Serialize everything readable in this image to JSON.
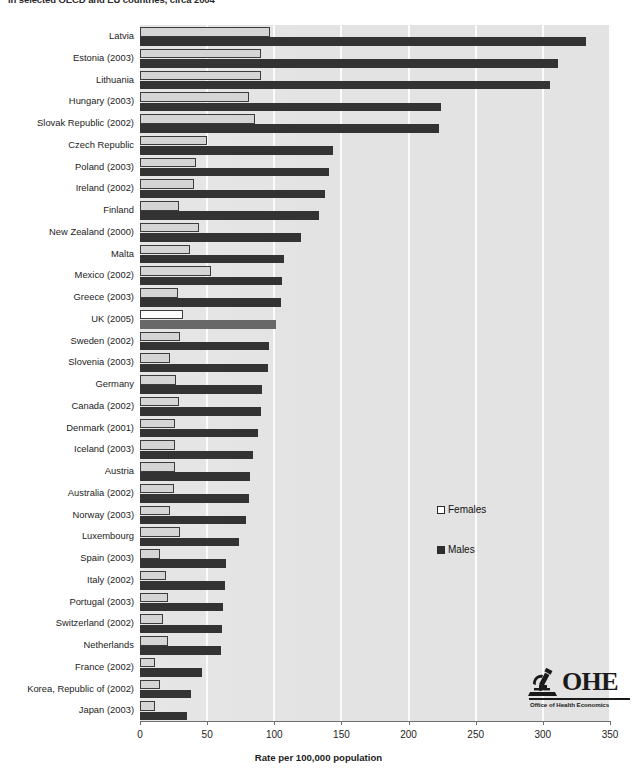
{
  "title": "in selected OECD and EU countries, circa 2004",
  "legend": {
    "female_label": "Females",
    "male_label": "Males"
  },
  "logo": {
    "letters": "OHE",
    "subtitle": "Office of Health Economics"
  },
  "colors": {
    "female_bar": "#d5d5d5",
    "male_bar": "#333333",
    "highlight_female_bar": "#fcfcfc",
    "highlight_male_bar": "#686868",
    "plot_background": "#e3e3e3",
    "gridline": "#fbfbfb"
  },
  "chart_data": {
    "type": "bar",
    "orientation": "horizontal",
    "title": "in selected OECD and EU countries, circa 2004",
    "xlabel": "Rate per 100,000 population",
    "ylabel": "",
    "xlim": [
      0,
      350
    ],
    "xticks": [
      0,
      50,
      100,
      150,
      200,
      250,
      300,
      350
    ],
    "grid": true,
    "legend_position": "center-right",
    "highlight_category": "UK (2005)",
    "categories": [
      "Latvia",
      "Estonia (2003)",
      "Lithuania",
      "Hungary (2003)",
      "Slovak Republic (2002)",
      "Czech Republic",
      "Poland (2003)",
      "Ireland (2002)",
      "Finland",
      "New Zealand (2000)",
      "Malta",
      "Mexico (2002)",
      "Greece (2003)",
      "UK (2005)",
      "Sweden (2002)",
      "Slovenia (2003)",
      "Germany",
      "Canada (2002)",
      "Denmark (2001)",
      "Iceland (2003)",
      "Austria",
      "Australia (2002)",
      "Norway (2003)",
      "Luxembourg",
      "Spain (2003)",
      "Italy (2002)",
      "Portugal (2003)",
      "Switzerland (2002)",
      "Netherlands",
      "France (2002)",
      "Korea, Republic of (2002)",
      "Japan (2003)"
    ],
    "series": [
      {
        "name": "Females",
        "values": [
          97,
          90,
          90,
          81,
          86,
          50,
          42,
          40,
          29,
          44,
          37,
          53,
          28,
          32,
          30,
          22,
          27,
          29,
          26,
          26,
          26,
          25,
          22,
          30,
          15,
          19,
          21,
          17,
          21,
          11,
          15,
          11
        ]
      },
      {
        "name": "Males",
        "values": [
          332,
          311,
          305,
          224,
          223,
          144,
          141,
          138,
          133,
          120,
          107,
          106,
          105,
          101,
          96,
          95,
          91,
          90,
          88,
          84,
          82,
          81,
          79,
          74,
          64,
          63,
          62,
          61,
          60,
          46,
          38,
          35
        ]
      }
    ]
  },
  "axis": {
    "title": "Rate per 100,000 population"
  }
}
